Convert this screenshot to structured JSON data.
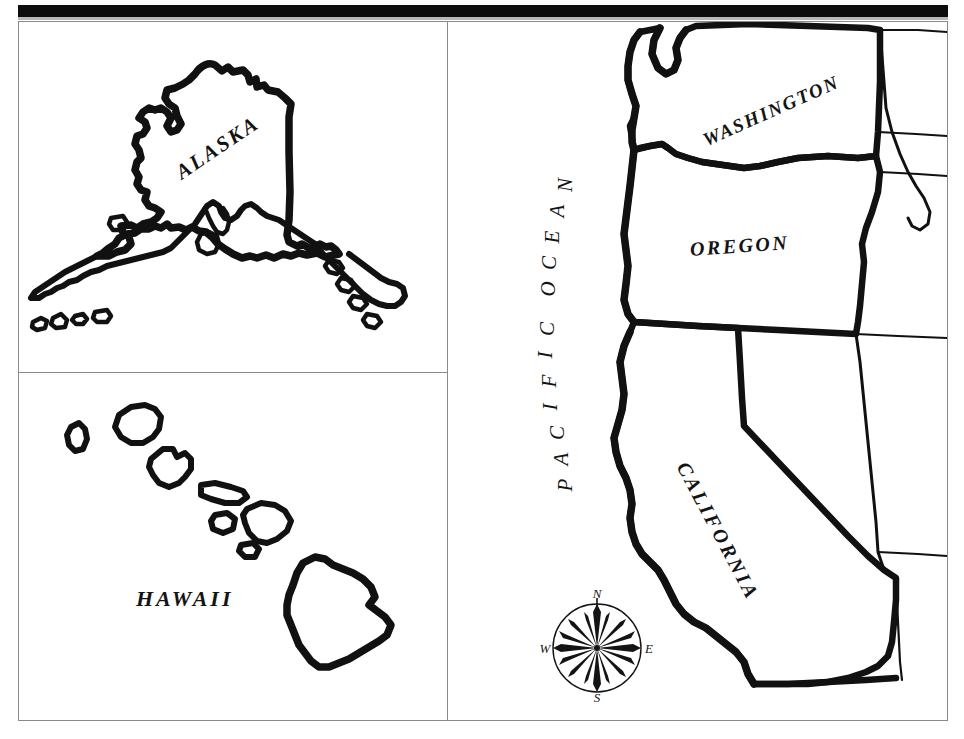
{
  "document": {
    "type": "map",
    "title": "United States West Coast Outline Map",
    "style": "hand-drawn black-and-white outline map",
    "background_color": "#ffffff",
    "ink_color": "#111111",
    "frame_color": "#8a8a8a"
  },
  "panels": [
    {
      "id": "alaska",
      "name": "alaska-inset-panel",
      "position": "top-left",
      "label": "ALASKA",
      "label_rotation_deg": -34
    },
    {
      "id": "hawaii",
      "name": "hawaii-inset-panel",
      "position": "bottom-left",
      "label": "HAWAII",
      "label_rotation_deg": 0,
      "island_count": 8
    },
    {
      "id": "mainland",
      "name": "west-coast-main-panel",
      "position": "right",
      "labels": [
        "WASHINGTON",
        "OREGON",
        "CALIFORNIA",
        "PACIFIC OCEAN"
      ]
    }
  ],
  "labels": {
    "alaska": "ALASKA",
    "hawaii": "HAWAII",
    "washington": "WASHINGTON",
    "oregon": "OREGON",
    "california": "CALIFORNIA",
    "pacific_ocean": "PACIFIC OCEAN"
  },
  "pacific_ocean_chars": [
    "P",
    "A",
    "C",
    "I",
    "F",
    "I",
    "C",
    " ",
    "O",
    "C",
    "E",
    "A",
    "N"
  ],
  "compass": {
    "name": "compass-rose",
    "points": 16,
    "north": "N",
    "east": "E",
    "south": "S",
    "west": "W"
  },
  "states_depicted": [
    "Alaska",
    "Hawaii",
    "Washington",
    "Oregon",
    "California"
  ],
  "neighbor_outlines": [
    "Idaho",
    "Nevada",
    "Arizona"
  ]
}
